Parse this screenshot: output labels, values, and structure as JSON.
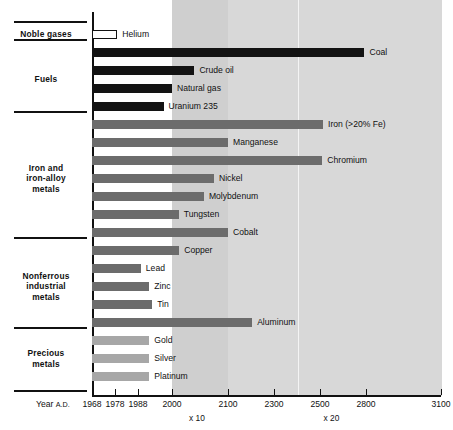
{
  "chart_data": {
    "type": "bar",
    "title": "",
    "subtitle": "",
    "xlabel": "Year A.D.",
    "ylabel": "",
    "orientation": "horizontal",
    "grid": false,
    "legend": "none",
    "xlim": [
      1968,
      3100
    ],
    "axis": {
      "origin_label": "Year A.D.",
      "origin_label_small": "A.D.",
      "ticks": [
        {
          "label": "1968",
          "x": 1968
        },
        {
          "label": "1978",
          "x": 1978
        },
        {
          "label": "1988",
          "x": 1988
        },
        {
          "label": "2000",
          "x": 2000
        },
        {
          "label": "2100",
          "x": 2100
        },
        {
          "label": "2300",
          "x": 2300
        },
        {
          "label": "2500",
          "x": 2500
        },
        {
          "label": "2800",
          "x": 2800
        },
        {
          "label": "3100",
          "x": 3100
        }
      ],
      "multiplier_bands": [
        {
          "label": "x 10",
          "from": 2000,
          "to": 2100
        },
        {
          "label": "x 20",
          "from": 2100,
          "to": 3100
        }
      ]
    },
    "groups": [
      {
        "name": "Noble gases",
        "name_lines": [
          "Noble gases"
        ],
        "bars": [
          {
            "label": "Helium",
            "value": 1979,
            "style": "open"
          }
        ]
      },
      {
        "name": "Fuels",
        "name_lines": [
          "Fuels"
        ],
        "bars": [
          {
            "label": "Coal",
            "value": 2790,
            "style": "black"
          },
          {
            "label": "Crude oil",
            "value": 2040,
            "style": "black"
          },
          {
            "label": "Natural gas",
            "value": 2000,
            "style": "black"
          },
          {
            "label": "Uranium 235",
            "value": 1997,
            "style": "black"
          }
        ]
      },
      {
        "name": "Iron and iron-alloy metals",
        "name_lines": [
          "Iron and",
          "iron-alloy",
          "metals"
        ],
        "bars": [
          {
            "label": "Iron (>20% Fe)",
            "value": 2520,
            "style": "dark"
          },
          {
            "label": "Manganese",
            "value": 2100,
            "style": "dark"
          },
          {
            "label": "Chromium",
            "value": 2515,
            "style": "dark"
          },
          {
            "label": "Nickel",
            "value": 2075,
            "style": "dark"
          },
          {
            "label": "Molybdenum",
            "value": 2057,
            "style": "dark"
          },
          {
            "label": "Tungsten",
            "value": 2012,
            "style": "dark"
          },
          {
            "label": "Cobalt",
            "value": 2100,
            "style": "dark"
          }
        ]
      },
      {
        "name": "Nonferrous industrial metals",
        "name_lines": [
          "Nonferrous",
          "industrial",
          "metals"
        ],
        "bars": [
          {
            "label": "Copper",
            "value": 2013,
            "style": "dark"
          },
          {
            "label": "Lead",
            "value": 1989,
            "style": "dark"
          },
          {
            "label": "Zinc",
            "value": 1992,
            "style": "dark"
          },
          {
            "label": "Tin",
            "value": 1993,
            "style": "dark"
          },
          {
            "label": "Aluminum",
            "value": 2205,
            "style": "dark"
          }
        ]
      },
      {
        "name": "Precious metals",
        "name_lines": [
          "Precious",
          "metals"
        ],
        "bars": [
          {
            "label": "Gold",
            "value": 1992,
            "style": "light"
          },
          {
            "label": "Silver",
            "value": 1992,
            "style": "light"
          },
          {
            "label": "Platinum",
            "value": 1992,
            "style": "light"
          }
        ]
      }
    ]
  },
  "style": {
    "bar_black": "#131313",
    "bar_dark": "#6c6c6c",
    "bar_light": "#a7a7a7",
    "bar_open_fill": "#ffffff",
    "bar_open_stroke": "#131313",
    "band_x10": "#cfcfcf",
    "band_x20": "#d8d8d8",
    "axis": "#111111",
    "text": "#111111",
    "page_background": "#ffffff"
  },
  "layout": {
    "bar_pitch_px": 18,
    "bar_height_px": 9,
    "plot_left_px": 92,
    "plot_right_px": 441
  }
}
